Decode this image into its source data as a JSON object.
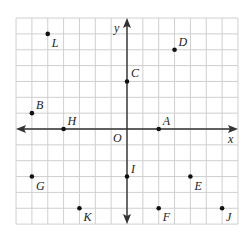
{
  "chart_data": {
    "type": "scatter",
    "title": "",
    "xlabel": "x",
    "ylabel": "y",
    "origin_label": "O",
    "xlim": [
      -7,
      7
    ],
    "ylim": [
      -6,
      7
    ],
    "grid": true,
    "points": [
      {
        "label": "L",
        "x": -5,
        "y": 6
      },
      {
        "label": "D",
        "x": 3,
        "y": 5
      },
      {
        "label": "C",
        "x": 0,
        "y": 3
      },
      {
        "label": "B",
        "x": -6,
        "y": 1
      },
      {
        "label": "H",
        "x": -4,
        "y": 0
      },
      {
        "label": "A",
        "x": 2,
        "y": 0
      },
      {
        "label": "G",
        "x": -6,
        "y": -3
      },
      {
        "label": "I",
        "x": 0,
        "y": -3
      },
      {
        "label": "E",
        "x": 4,
        "y": -3
      },
      {
        "label": "K",
        "x": -3,
        "y": -5
      },
      {
        "label": "F",
        "x": 2,
        "y": -5
      },
      {
        "label": "J",
        "x": 6,
        "y": -5
      }
    ],
    "label_offsets": {
      "L": "below-right",
      "D": "above-right",
      "C": "above-right",
      "B": "above-right",
      "H": "above-right",
      "A": "above-right",
      "G": "below-right",
      "I": "above-right",
      "E": "below-right",
      "K": "below-right",
      "F": "below-right",
      "J": "below-right"
    }
  }
}
